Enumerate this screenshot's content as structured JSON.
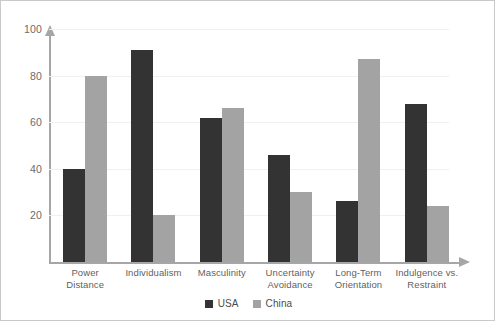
{
  "chart_data": {
    "type": "bar",
    "title": "",
    "subtitle": "",
    "xlabel": "",
    "ylabel": "",
    "ylim": [
      0,
      100
    ],
    "grid": true,
    "legend_position": "bottom",
    "categories": [
      "Power\nDistance",
      "Individualism",
      "Masculinity",
      "Uncertainty\nAvoidance",
      "Long-Term\nOrientation",
      "Indulgence vs.\nRestraint"
    ],
    "ytick_labels": [
      "100",
      "80",
      "60",
      "40",
      "20"
    ],
    "ytick_values": [
      100,
      80,
      60,
      40,
      20
    ],
    "series": [
      {
        "name": "USA",
        "color": "#333333",
        "values": [
          40,
          91,
          62,
          46,
          26,
          68
        ]
      },
      {
        "name": "China",
        "color": "#a3a3a3",
        "values": [
          80,
          20,
          66,
          30,
          87,
          24
        ]
      }
    ]
  },
  "legend": {
    "items": [
      {
        "label": "USA",
        "color": "#333333"
      },
      {
        "label": "China",
        "color": "#a3a3a3"
      }
    ]
  },
  "axis": {
    "y_max": 100,
    "y_min": 0
  }
}
